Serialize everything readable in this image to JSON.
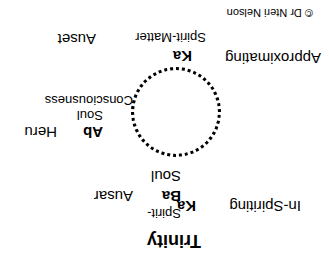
{
  "diagram": {
    "title": "Trinity",
    "credit": "© Dr Ntеri Nelson",
    "orientation": "rotated 180 degrees",
    "nodes": {
      "bottom": {
        "ka": "Ka",
        "ba": "Ba",
        "spirit": "Spirit-",
        "soul": "Soul",
        "left_label": "In-Spiriting",
        "right_label": "Ausar"
      },
      "left": {
        "ab": "Ab",
        "soul": "Soul",
        "consciousness": "Consciousness",
        "label": "Heru"
      },
      "top": {
        "ka": "Ka",
        "spirit_matter": "Spirit-Matter",
        "left_label": "Approximating",
        "right_label": "Auset"
      }
    }
  }
}
